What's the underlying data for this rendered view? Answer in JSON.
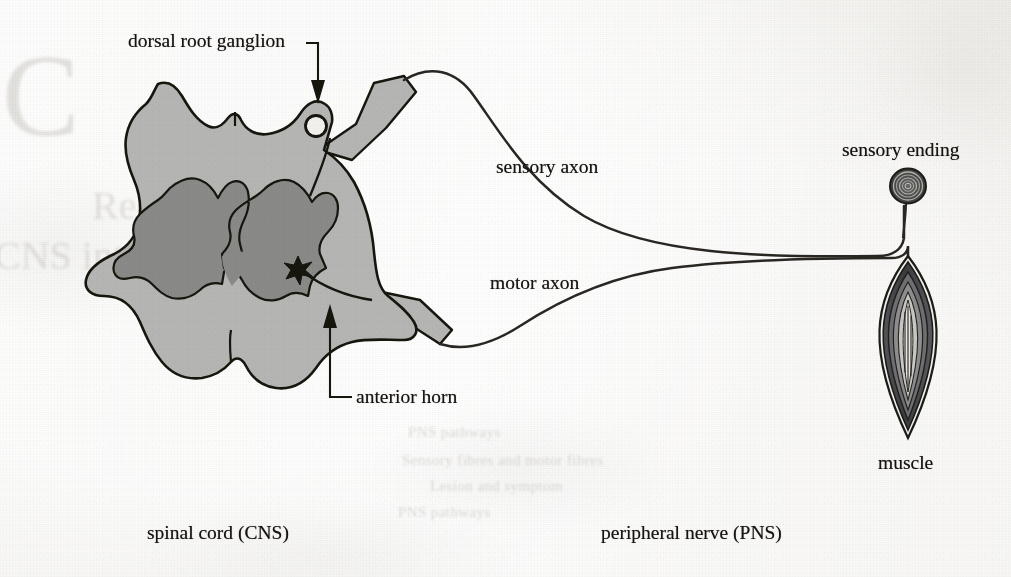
{
  "figure": {
    "kind": "anatomical-line-diagram",
    "background_color": "#efeeea",
    "ink_color": "#17140f",
    "white_matter_color": "#b6b6b4",
    "gray_matter_color": "#8a8a88"
  },
  "labels": {
    "dorsal_root_ganglion": "dorsal root ganglion",
    "sensory_axon": "sensory axon",
    "motor_axon": "motor axon",
    "sensory_ending": "sensory ending",
    "muscle": "muscle",
    "anterior_horn": "anterior horn"
  },
  "captions": {
    "left": "spinal cord (CNS)",
    "right": "peripheral nerve (PNS)"
  },
  "structures": [
    {
      "name": "spinal-cord-white-matter",
      "note": "butterfly-bordered oval cross-section, light gray fill"
    },
    {
      "name": "spinal-cord-gray-matter",
      "note": "H / butterfly shaped darker gray core with posterior and anterior horns"
    },
    {
      "name": "dorsal-root",
      "note": "gray sleeve leaving cord dorsally to the right"
    },
    {
      "name": "dorsal-root-ganglion",
      "note": "small open circle on the dorsal root"
    },
    {
      "name": "ventral-root",
      "note": "gray sleeve leaving cord ventrally to the right"
    },
    {
      "name": "motor-neuron-cell-body",
      "note": "small dark star in the anterior horn"
    },
    {
      "name": "sensory-axon-line",
      "note": "long curve from dorsal root ganglion to sensory ending"
    },
    {
      "name": "motor-axon-line",
      "note": "long curve from ventral root to muscle"
    },
    {
      "name": "sensory-ending",
      "note": "concentric ringed corpuscle on a stalk"
    },
    {
      "name": "skeletal-muscle",
      "note": "fusiform spindle with nested fiber layers"
    }
  ],
  "leaders": [
    {
      "name": "dorsal-root-ganglion-leader",
      "shape": "elbow-right-then-down",
      "arrow": "down"
    },
    {
      "name": "anterior-horn-leader",
      "shape": "elbow-left-then-up",
      "arrow": "up"
    }
  ],
  "ghost_text": {
    "note": "illegible show-through from the reverse of the scanned page",
    "lines": [
      "Reflex and nerve",
      "CNS integration",
      "PNS pathways",
      "Sensory fibres and motor fibres",
      "Lesion and symptom"
    ]
  }
}
